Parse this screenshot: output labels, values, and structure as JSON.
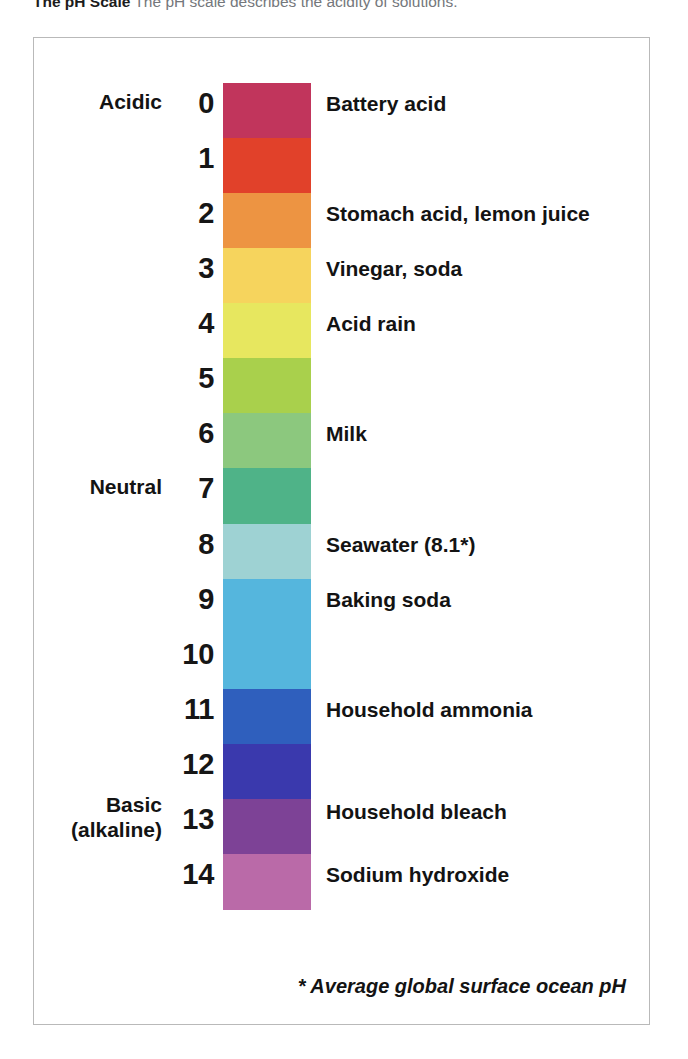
{
  "caption": {
    "title": "The pH Scale",
    "description": "The pH scale describes the acidity of solutions."
  },
  "footnote": "* Average global surface ocean pH",
  "category_labels": [
    {
      "name": "acidic",
      "lines": [
        "Acidic"
      ],
      "ph": 0
    },
    {
      "name": "neutral",
      "lines": [
        "Neutral"
      ],
      "ph": 7
    },
    {
      "name": "basic",
      "lines": [
        "Basic",
        "(alkaline)"
      ],
      "ph": 13
    }
  ],
  "chart_data": {
    "type": "bar",
    "title": "The pH Scale",
    "subtitle": "The pH scale describes the acidity of solutions.",
    "xlabel": "",
    "ylabel": "pH",
    "ylim": [
      0,
      14
    ],
    "orientation": "vertical-descending",
    "grid": false,
    "legend": "none",
    "categories": [
      0,
      1,
      2,
      3,
      4,
      5,
      6,
      7,
      8,
      9,
      10,
      11,
      12,
      13,
      14
    ],
    "tick_labels": [
      "0",
      "1",
      "2",
      "3",
      "4",
      "5",
      "6",
      "7",
      "8",
      "9",
      "10",
      "11",
      "12",
      "13",
      "14"
    ],
    "colors": [
      "#c33b5e",
      "#e04228",
      "#ed9440",
      "#f5d45c",
      "#e8e85e",
      "#a9d04b",
      "#8bc77e",
      "#53b586",
      "#9ed2d2",
      "#57b6dc",
      "#57b6dc",
      "#3060bd",
      "#3b3bae",
      "#7e4296",
      "#b濃"
    ],
    "bands": [
      {
        "ph": 0,
        "color": "#c1355c",
        "label": "Battery acid"
      },
      {
        "ph": 1,
        "color": "#e1412a",
        "label": ""
      },
      {
        "ph": 2,
        "color": "#ed9442",
        "label": "Stomach acid, lemon juice"
      },
      {
        "ph": 3,
        "color": "#f6d45d",
        "label": "Vinegar, soda"
      },
      {
        "ph": 4,
        "color": "#e7e75f",
        "label": "Acid rain"
      },
      {
        "ph": 5,
        "color": "#a9d04c",
        "label": ""
      },
      {
        "ph": 6,
        "color": "#8cc87e",
        "label": "Milk"
      },
      {
        "ph": 7,
        "color": "#4fb388",
        "label": ""
      },
      {
        "ph": 8,
        "color": "#9ed2d3",
        "label": "Seawater (8.1*)"
      },
      {
        "ph": 9,
        "color": "#55b6dd",
        "label": "Baking soda"
      },
      {
        "ph": 10,
        "color": "#55b6dd",
        "label": ""
      },
      {
        "ph": 11,
        "color": "#2f5fbd",
        "label": "Household ammonia"
      },
      {
        "ph": 12,
        "color": "#3a39ad",
        "label": ""
      },
      {
        "ph": 13,
        "color": "#7d4296",
        "label": "Household bleach"
      },
      {
        "ph": 14,
        "color": "#b濃",
        "label": "Sodium hydroxide"
      }
    ]
  },
  "bands": [
    {
      "ph": "0",
      "color": "#c1355c"
    },
    {
      "ph": "1",
      "color": "#e1412a"
    },
    {
      "ph": "2",
      "color": "#ed9442"
    },
    {
      "ph": "3",
      "color": "#f6d45d"
    },
    {
      "ph": "4",
      "color": "#e7e75f"
    },
    {
      "ph": "5",
      "color": "#a9d04c"
    },
    {
      "ph": "6",
      "color": "#8cc87e"
    },
    {
      "ph": "7",
      "color": "#4fb388"
    },
    {
      "ph": "8",
      "color": "#9ed2d3"
    },
    {
      "ph": "9",
      "color": "#55b6dd"
    },
    {
      "ph": "10",
      "color": "#55b6dd"
    },
    {
      "ph": "11",
      "color": "#2f5fbd"
    },
    {
      "ph": "12",
      "color": "#3a39ad"
    },
    {
      "ph": "13",
      "color": "#7d4296"
    },
    {
      "ph": "14",
      "color": "#ba6aa8"
    }
  ],
  "substances": [
    {
      "name": "battery-acid",
      "label": "Battery acid",
      "ph": 0
    },
    {
      "name": "stomach-acid",
      "label": "Stomach acid, lemon juice",
      "ph": 2
    },
    {
      "name": "vinegar-soda",
      "label": "Vinegar, soda",
      "ph": 3
    },
    {
      "name": "acid-rain",
      "label": "Acid rain",
      "ph": 4
    },
    {
      "name": "milk",
      "label": "Milk",
      "ph": 6
    },
    {
      "name": "seawater",
      "label": "Seawater (8.1*)",
      "ph": 8
    },
    {
      "name": "baking-soda",
      "label": "Baking soda",
      "ph": 9
    },
    {
      "name": "household-ammonia",
      "label": "Household ammonia",
      "ph": 11
    },
    {
      "name": "household-bleach",
      "label": "Household bleach",
      "ph": 12.85
    },
    {
      "name": "sodium-hydroxide",
      "label": "Sodium hydroxide",
      "ph": 14
    }
  ]
}
